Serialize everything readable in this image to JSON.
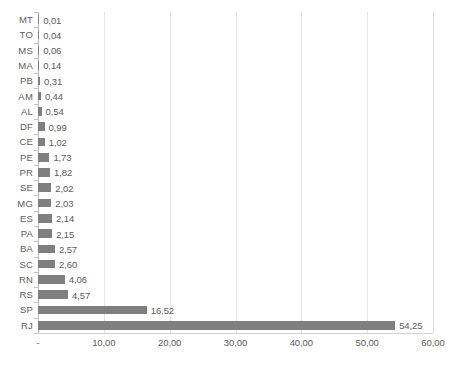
{
  "chart_data": {
    "type": "bar",
    "orientation": "horizontal",
    "title": "",
    "subtitle": "",
    "xlabel": "",
    "ylabel": "",
    "xlim": [
      0,
      60
    ],
    "grid": true,
    "legend": false,
    "legend_position": "none",
    "decimal_separator": ",",
    "bar_color": "#7f7f7f",
    "gridline_color": "#e4e4e6",
    "axis_color": "#b8b8ba",
    "text_color": "#5d5d5d",
    "x_tick_labels": [
      "-",
      "10,00",
      "20,00",
      "30,00",
      "40,00",
      "50,00",
      "60,00"
    ],
    "x_tick_values": [
      0,
      10,
      20,
      30,
      40,
      50,
      60
    ],
    "categories": [
      "MT",
      "TO",
      "MS",
      "MA",
      "PB",
      "AM",
      "AL",
      "DF",
      "CE",
      "PE",
      "PR",
      "SE",
      "MG",
      "ES",
      "PA",
      "BA",
      "SC",
      "RN",
      "RS",
      "SP",
      "RJ"
    ],
    "values": [
      0.01,
      0.04,
      0.06,
      0.14,
      0.31,
      0.44,
      0.54,
      0.99,
      1.02,
      1.73,
      1.82,
      2.02,
      2.03,
      2.14,
      2.15,
      2.57,
      2.6,
      4.06,
      4.57,
      16.52,
      54.25
    ],
    "data_labels": [
      "0,01",
      "0,04",
      "0,06",
      "0,14",
      "0,31",
      "0,44",
      "0,54",
      "0,99",
      "1,02",
      "1,73",
      "1,82",
      "2,02",
      "2,03",
      "2,14",
      "2,15",
      "2,57",
      "2,60",
      "4,06",
      "4,57",
      "16,52",
      "54,25"
    ]
  },
  "footnote": ""
}
